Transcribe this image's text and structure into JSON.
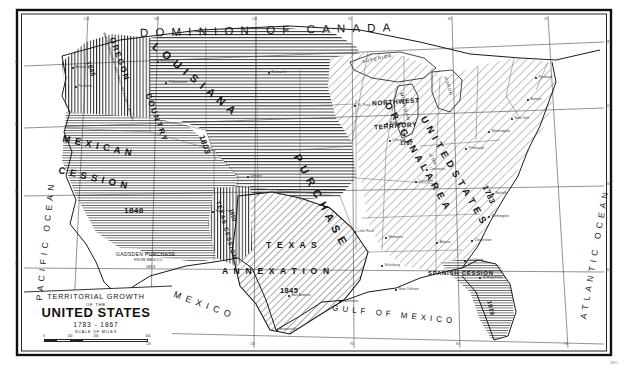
{
  "map": {
    "title_lines": {
      "line1": "TERRITORIAL GROWTH",
      "line2": "OF THE",
      "line3": "UNITED STATES",
      "line4": "1783 - 1867",
      "scale_caption": "SCALE OF MILES"
    },
    "scale_ticks": [
      "0",
      "100",
      "200",
      "400"
    ],
    "imprint": "S.P.C.",
    "frame_color": "#111111",
    "ink_color": "#1a1a1a",
    "paper_color": "#fdfdfb"
  },
  "oceans": [
    {
      "name": "pacific-ocean",
      "text": "PACIFIC OCEAN"
    },
    {
      "name": "atlantic-ocean",
      "text": "ATLANTIC OCEAN"
    },
    {
      "name": "gulf-of-mexico",
      "text": "GULF OF MEXICO"
    }
  ],
  "neighbors": [
    {
      "name": "dominion-of-canada",
      "text": "DOMINION OF CANADA"
    },
    {
      "name": "mexico",
      "text": "MEXICO"
    }
  ],
  "territories": [
    {
      "name": "oregon-country",
      "label": "OREGON COUNTRY",
      "year": "1846",
      "note": "BRITISH DISCOVERY AND TREATY WITH GREAT BRITAIN",
      "hatch": "vertical"
    },
    {
      "name": "louisiana-purchase",
      "label": "LOUISIANA PURCHASE",
      "year": "1803",
      "note": "",
      "hatch": "horizontal"
    },
    {
      "name": "mexican-cession",
      "label": "MEXICAN CESSION",
      "year": "1848",
      "note": "",
      "hatch": "horizontal"
    },
    {
      "name": "gadsden-purchase",
      "label": "GADSDEN PURCHASE",
      "year": "1853",
      "note": "FROM MEXICO",
      "hatch": "horizontal"
    },
    {
      "name": "texas-annexation",
      "label": "TEXAS ANNEXATION",
      "year": "1845",
      "note": "",
      "hatch": "diagonal"
    },
    {
      "name": "texas-cession",
      "label": "TEXAS CESSION",
      "year": "1850",
      "note": "",
      "hatch": "vertical"
    },
    {
      "name": "original-area-united-states",
      "label": "ORIGINAL AREA OF THE UNITED STATES",
      "year": "1783",
      "note": "",
      "hatch": "diagonal"
    },
    {
      "name": "northwest-territory",
      "label": "NORTHWEST TERRITORY",
      "year": "1787",
      "note": "",
      "hatch": "diagonal"
    },
    {
      "name": "spanish-cession",
      "label": "SPANISH CESSION",
      "year": "1819",
      "note": "",
      "hatch": "horizontal"
    }
  ],
  "territory_text": {
    "oregon_country_word1": "OREGON",
    "oregon_country_word2": "COUNTRY",
    "oregon_year": "1846",
    "oregon_note": "BRITISH DISCOVERY AND TREATY WITH GREAT BRITAIN",
    "louisiana_word1": "L O U I S I A N A",
    "louisiana_word2": "P U R C H A S E",
    "louisiana_year": "1803",
    "mexican_word1": "M E X I C A N",
    "mexican_word2": "C E S S I O N",
    "mexican_year": "1848",
    "gadsden_line1": "GADSDEN PURCHASE",
    "gadsden_line2": "FROM MEXICO",
    "gadsden_year": "1853",
    "texas_word1": "T E X A S",
    "texas_word2": "A N N E X A T I O N",
    "texas_year": "1845",
    "texas_cession_label": "TEXAS CESSION",
    "texas_cession_year": "1850",
    "original_word1": "O R I G I N A L   A R E A",
    "original_word2": "of the",
    "original_word3": "U N I T E D   S T A T E S",
    "original_year": "1783",
    "northwest_word1": "NORTHWEST",
    "northwest_word2": "TERRITORY",
    "northwest_year": "1787",
    "spanish_label": "SPANISH CESSION",
    "spanish_year": "1819"
  },
  "lakes": [
    {
      "name": "lake-superior",
      "text": "SUPERIOR"
    },
    {
      "name": "lake-michigan",
      "text": "MICHIGAN"
    },
    {
      "name": "lake-huron",
      "text": "HURON"
    }
  ],
  "cities": [
    {
      "name": "astoria",
      "text": "Astoria",
      "x": 73,
      "y": 68
    },
    {
      "name": "portland-or",
      "text": "Portland",
      "x": 76,
      "y": 87
    },
    {
      "name": "missoula",
      "text": "Missoula",
      "x": 158,
      "y": 62
    },
    {
      "name": "bismarck",
      "text": "Bismarck",
      "x": 269,
      "y": 73
    },
    {
      "name": "yellowstone",
      "text": "Yellowstone",
      "x": 166,
      "y": 83
    },
    {
      "name": "denver",
      "text": "Denver",
      "x": 248,
      "y": 177
    },
    {
      "name": "santa-fe",
      "text": "Santa Fe",
      "x": 213,
      "y": 212
    },
    {
      "name": "san-antonio",
      "text": "San Antonio",
      "x": 289,
      "y": 296
    },
    {
      "name": "galveston",
      "text": "Galveston",
      "x": 340,
      "y": 302
    },
    {
      "name": "brownsville",
      "text": "Brownsville",
      "x": 277,
      "y": 330
    },
    {
      "name": "little-rock",
      "text": "Little Rock",
      "x": 355,
      "y": 232
    },
    {
      "name": "new-orleans",
      "text": "New Orleans",
      "x": 396,
      "y": 290
    },
    {
      "name": "vicksburg",
      "text": "Vicksburg",
      "x": 382,
      "y": 266
    },
    {
      "name": "memphis",
      "text": "Memphis",
      "x": 386,
      "y": 238
    },
    {
      "name": "st-paul",
      "text": "St. Paul",
      "x": 355,
      "y": 106
    },
    {
      "name": "milwaukee",
      "text": "Milwaukee",
      "x": 387,
      "y": 124
    },
    {
      "name": "chicago",
      "text": "Chicago",
      "x": 390,
      "y": 141
    },
    {
      "name": "louisville",
      "text": "Louisville",
      "x": 416,
      "y": 182
    },
    {
      "name": "cincinnati",
      "text": "Cincinnati",
      "x": 427,
      "y": 170
    },
    {
      "name": "pittsburgh",
      "text": "Pittsburgh",
      "x": 466,
      "y": 149
    },
    {
      "name": "atlanta",
      "text": "Atlanta",
      "x": 437,
      "y": 243
    },
    {
      "name": "savannah",
      "text": "Savannah",
      "x": 465,
      "y": 261
    },
    {
      "name": "charleston",
      "text": "Charleston",
      "x": 472,
      "y": 241
    },
    {
      "name": "wilmington",
      "text": "Wilmington",
      "x": 489,
      "y": 217
    },
    {
      "name": "norfolk",
      "text": "Norfolk",
      "x": 493,
      "y": 194
    },
    {
      "name": "washington",
      "text": "Washington",
      "x": 489,
      "y": 132
    },
    {
      "name": "new-york",
      "text": "New York",
      "x": 512,
      "y": 119
    },
    {
      "name": "boston",
      "text": "Boston",
      "x": 528,
      "y": 100
    },
    {
      "name": "portland-me",
      "text": "Portland",
      "x": 536,
      "y": 78
    },
    {
      "name": "st-augustine",
      "text": "St Augustine",
      "x": 480,
      "y": 278
    }
  ],
  "graticule": {
    "top_ticks": [
      "124",
      "118",
      "108",
      "94",
      "84",
      "74"
    ],
    "bottom_ticks": [
      "118",
      "108",
      "94",
      "84",
      "74"
    ],
    "left_ticks": [
      "48",
      "42",
      "36",
      "30"
    ],
    "right_ticks": [
      "48",
      "42",
      "36",
      "30"
    ]
  }
}
